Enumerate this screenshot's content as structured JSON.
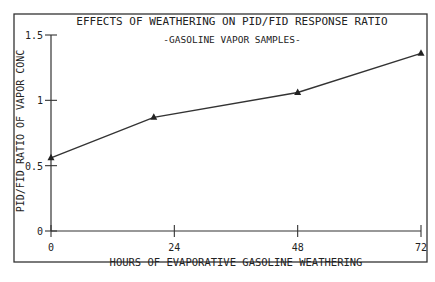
{
  "chart_data": {
    "type": "line",
    "title": "EFFECTS OF WEATHERING ON PID/FID RESPONSE RATIO",
    "subtitle": "-GASOLINE VAPOR SAMPLES-",
    "xlabel": "HOURS OF EVAPORATIVE GASOLINE WEATHERING",
    "ylabel": "PID/FID RATIO OF VAPOR CONC",
    "x": [
      0,
      20,
      48,
      72
    ],
    "series": [
      {
        "name": "PID/FID ratio",
        "marker": "triangle",
        "values": [
          0.56,
          0.87,
          1.06,
          1.36
        ]
      }
    ],
    "xlim": [
      0,
      72
    ],
    "ylim": [
      0,
      1.5
    ],
    "xticks": [
      "0",
      "24",
      "48",
      "72"
    ],
    "yticks": [
      "0",
      "0.5",
      "1",
      "1.5"
    ],
    "grid": false,
    "legend": "none"
  }
}
